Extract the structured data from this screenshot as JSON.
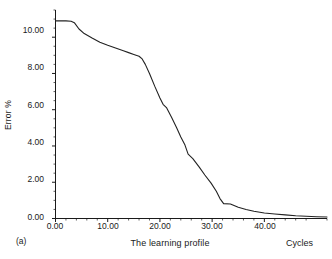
{
  "figure": {
    "panel_label": "(a)",
    "background_color": "#ffffff",
    "line_color": "#222222",
    "axis_color": "#1a1a1a"
  },
  "chart_data": {
    "type": "line",
    "title": "",
    "subtitle": "",
    "xlabel": "The learning profile",
    "ylabel": "Error %",
    "x_units_label": "Cycles",
    "panel": "(a)",
    "xlim": [
      0.0,
      52.0
    ],
    "ylim": [
      0.0,
      11.5
    ],
    "grid": false,
    "legend": "none",
    "xticks": [
      0.0,
      10.0,
      20.0,
      30.0,
      40.0
    ],
    "xtick_labels": [
      "0.00",
      "10.00",
      "20.00",
      "30.00",
      "40.00"
    ],
    "x_minor_tick_interval": 2.0,
    "yticks": [
      0.0,
      2.0,
      4.0,
      6.0,
      8.0,
      10.0
    ],
    "ytick_labels": [
      "0.00",
      "2.00",
      "4.00",
      "6.00",
      "8.00",
      "10.00"
    ],
    "y_minor_tick_interval": 0.5,
    "series": [
      {
        "name": "Error %",
        "x": [
          0.0,
          1.0,
          2.0,
          3.0,
          3.6,
          4.5,
          5.5,
          7.0,
          8.5,
          10.0,
          11.5,
          13.0,
          14.0,
          15.0,
          16.0,
          16.6,
          17.2,
          18.0,
          19.0,
          20.0,
          20.6,
          21.3,
          22.2,
          23.2,
          24.0,
          24.8,
          25.4,
          26.3,
          27.5,
          28.6,
          29.8,
          30.8,
          31.5,
          32.2,
          33.5,
          35.0,
          36.5,
          38.0,
          40.0,
          42.0,
          44.0,
          46.0,
          48.0,
          50.0,
          52.0
        ],
        "y": [
          10.9,
          10.9,
          10.9,
          10.88,
          10.8,
          10.45,
          10.2,
          9.95,
          9.72,
          9.55,
          9.4,
          9.25,
          9.15,
          9.05,
          8.95,
          8.8,
          8.5,
          8.0,
          7.3,
          6.65,
          6.3,
          6.1,
          5.6,
          5.0,
          4.5,
          4.05,
          3.55,
          3.3,
          2.85,
          2.4,
          1.95,
          1.5,
          1.1,
          0.82,
          0.8,
          0.62,
          0.5,
          0.4,
          0.3,
          0.25,
          0.2,
          0.15,
          0.12,
          0.1,
          0.08
        ]
      }
    ]
  }
}
